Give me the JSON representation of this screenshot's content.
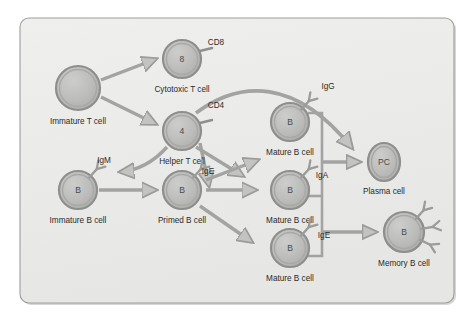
{
  "figure": {
    "panel": {
      "background_color": "#ececeb",
      "border_color": "#9a9a9a",
      "shadow_color": "#bdbdbd"
    },
    "palette": {
      "cell_fill": "#b9b9b7",
      "cell_fill_light": "#c7c7c5",
      "cell_stroke": "#8e8e8c",
      "arrow_color": "#9b9b99",
      "bus_line_color": "#9b9b99",
      "receptor_color": "#9b9b99",
      "text_color": "#2b2b2b"
    }
  },
  "cells": [
    {
      "id": "immature-t-cell",
      "label": "Immature T cell",
      "letter": "",
      "shape": "circle",
      "cx": 78,
      "cy": 88,
      "r": 22,
      "label_x": 78,
      "label_y": 124,
      "receptors": []
    },
    {
      "id": "cytotoxic-t-cell",
      "label": "Cytotoxic T cell",
      "letter": "8",
      "shape": "circle",
      "cx": 182,
      "cy": 59,
      "r": 19,
      "label_x": 182,
      "label_y": 92,
      "receptors": []
    },
    {
      "id": "helper-t-cell",
      "label": "Helper T cell",
      "letter": "4",
      "shape": "circle",
      "cx": 182,
      "cy": 131,
      "r": 19,
      "label_x": 182,
      "label_y": 164,
      "receptors": []
    },
    {
      "id": "immature-b-cell",
      "label": "Immature B cell",
      "letter": "B",
      "shape": "circle",
      "cx": 78,
      "cy": 190,
      "r": 19,
      "label_x": 78,
      "label_y": 223,
      "receptors": [
        "antibody"
      ]
    },
    {
      "id": "primed-b-cell",
      "label": "Primed B cell",
      "letter": "B",
      "shape": "circle",
      "cx": 182,
      "cy": 190,
      "r": 19,
      "label_x": 182,
      "label_y": 223,
      "receptors": [
        "antibody"
      ]
    },
    {
      "id": "mature-b-cell-igg",
      "label": "Mature B cell",
      "letter": "B",
      "shape": "circle",
      "cx": 290,
      "cy": 122,
      "r": 19,
      "label_x": 290,
      "label_y": 155,
      "receptors": [
        "antibody"
      ]
    },
    {
      "id": "mature-b-cell-iga",
      "label": "Mature B cell",
      "letter": "B",
      "shape": "circle",
      "cx": 290,
      "cy": 190,
      "r": 19,
      "label_x": 290,
      "label_y": 223,
      "receptors": [
        "antibody"
      ]
    },
    {
      "id": "mature-b-cell-ige",
      "label": "Mature B cell",
      "letter": "B",
      "shape": "circle",
      "cx": 290,
      "cy": 248,
      "r": 19,
      "label_x": 290,
      "label_y": 281,
      "receptors": [
        "antibody"
      ]
    },
    {
      "id": "plasma-cell",
      "label": "Plasma cell",
      "letter": "PC",
      "shape": "ellipse",
      "cx": 384,
      "cy": 162,
      "r": 17,
      "rx": 16,
      "ry": 19,
      "label_x": 384,
      "label_y": 194,
      "receptors": []
    },
    {
      "id": "memory-b-cell",
      "label": "Memory B cell",
      "letter": "B",
      "shape": "circle",
      "cx": 404,
      "cy": 232,
      "r": 20,
      "label_x": 404,
      "label_y": 266,
      "receptors": [
        "antibody",
        "antibody",
        "antibody"
      ]
    }
  ],
  "markers": [
    {
      "id": "cd8-label",
      "text": "CD8",
      "x": 216,
      "y": 45
    },
    {
      "id": "cd4-label",
      "text": "CD4",
      "x": 216,
      "y": 108
    },
    {
      "id": "igm-label",
      "text": "IgM",
      "x": 104,
      "y": 163
    },
    {
      "id": "ige-primed-label",
      "text": "IgE",
      "x": 208,
      "y": 174
    },
    {
      "id": "igg-label",
      "text": "IgG",
      "x": 328,
      "y": 89
    },
    {
      "id": "iga-label",
      "text": "IgA",
      "x": 322,
      "y": 178
    },
    {
      "id": "ige-mature-label",
      "text": "IgE",
      "x": 324,
      "y": 238
    }
  ]
}
